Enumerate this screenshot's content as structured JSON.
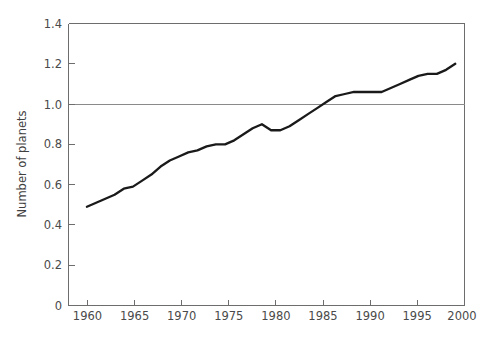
{
  "figure": {
    "caption": ""
  },
  "chart_data": {
    "type": "line",
    "title": "",
    "xlabel": "",
    "ylabel": "Number of planets",
    "xlim": [
      1959.0,
      2002.0
    ],
    "ylim": [
      0,
      1.4
    ],
    "grid": "single horizontal reference line at y = 1.0",
    "legend": "none",
    "xticks": [
      1960,
      1965,
      1970,
      1975,
      1980,
      1985,
      1990,
      1995,
      2000
    ],
    "xtick_labels": [
      "1960",
      "1965",
      "1970",
      "1975",
      "1980",
      "1985",
      "1990",
      "1995",
      "2000"
    ],
    "yticks": [
      0,
      0.2,
      0.4,
      0.6,
      0.8,
      1.0,
      1.2,
      1.4
    ],
    "ytick_labels": [
      "0",
      "0.2",
      "0.4",
      "0.6",
      "0.8",
      "1.0",
      "1.2",
      "1.4"
    ],
    "reference_lines": [
      {
        "orientation": "horizontal",
        "value": 1.0,
        "color": "#8a8a8a"
      }
    ],
    "series": [
      {
        "name": "Number of planets",
        "color": "#1a1a1a",
        "x": [
          1961,
          1962,
          1963,
          1964,
          1965,
          1966,
          1967,
          1968,
          1969,
          1970,
          1971,
          1972,
          1973,
          1974,
          1975,
          1976,
          1977,
          1978,
          1979,
          1980,
          1981,
          1982,
          1983,
          1984,
          1985,
          1986,
          1987,
          1988,
          1989,
          1990,
          1991,
          1992,
          1993,
          1994,
          1995,
          1996,
          1997,
          1998,
          1999,
          2000,
          2001
        ],
        "values": [
          0.49,
          0.51,
          0.53,
          0.55,
          0.58,
          0.59,
          0.62,
          0.65,
          0.69,
          0.72,
          0.74,
          0.76,
          0.77,
          0.79,
          0.8,
          0.8,
          0.82,
          0.85,
          0.88,
          0.9,
          0.87,
          0.87,
          0.89,
          0.92,
          0.95,
          0.98,
          1.01,
          1.04,
          1.05,
          1.06,
          1.06,
          1.06,
          1.06,
          1.08,
          1.1,
          1.12,
          1.14,
          1.15,
          1.15,
          1.17,
          1.2
        ]
      }
    ],
    "annotations": [
      {
        "label": "local-peak",
        "x": 1980,
        "y": 0.9
      },
      {
        "label": "local-dip",
        "x": 1981,
        "y": 0.87
      },
      {
        "label": "plateau-start",
        "x": 1989,
        "y": 1.05
      },
      {
        "label": "plateau-end",
        "x": 1993,
        "y": 1.06
      }
    ]
  }
}
